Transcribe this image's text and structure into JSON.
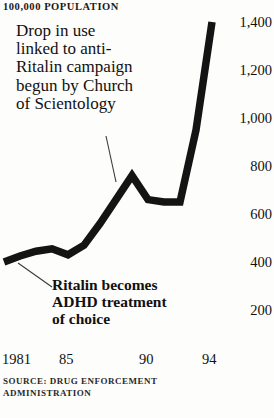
{
  "header": {
    "unit_label": "100,000 POPULATION"
  },
  "annotations": {
    "top": {
      "name": "scientology-campaign-note",
      "lines": [
        "Drop in use",
        "linked to anti-",
        "Ritalin campaign",
        "begun by Church",
        "of Scientology"
      ]
    },
    "bottom": {
      "name": "adhd-treatment-note",
      "lines": [
        "Ritalin becomes",
        "ADHD treatment",
        "of choice"
      ]
    }
  },
  "source": {
    "lines": [
      "SOURCE: DRUG ENFORCEMENT",
      "ADMINISTRATION"
    ]
  },
  "colors": {
    "line": "#141414",
    "text": "#111111",
    "background": "#fdfdfb",
    "leader": "#3a3a3a"
  },
  "chart_data": {
    "type": "line",
    "title": "",
    "subtitle": "",
    "xlabel": "",
    "ylabel": "100,000 POPULATION",
    "xlim": [
      1981,
      1994
    ],
    "ylim": [
      0,
      1500
    ],
    "grid": false,
    "legend": null,
    "y_ticks": [
      1400,
      1200,
      1000,
      800,
      600,
      400,
      200
    ],
    "y_tick_labels": [
      "1,400",
      "1,200",
      "1,000",
      "800",
      "600",
      "400",
      "200"
    ],
    "x_ticks": [
      1981,
      1985,
      1990,
      1994
    ],
    "x_tick_labels": [
      "1981",
      "85",
      "90",
      "94"
    ],
    "series": [
      {
        "name": "Ritalin prescriptions per 100,000 population",
        "x": [
          1981,
          1982,
          1983,
          1984,
          1985,
          1986,
          1987,
          1988,
          1989,
          1990,
          1991,
          1992,
          1993,
          1994
        ],
        "values": [
          400,
          425,
          445,
          455,
          430,
          470,
          560,
          660,
          760,
          660,
          650,
          650,
          950,
          1400
        ]
      }
    ],
    "annotations": [
      {
        "text": "Drop in use linked to anti-Ritalin campaign begun by Church of Scientology",
        "points_to_x": 1990,
        "points_to_y": 700
      },
      {
        "text": "Ritalin becomes ADHD treatment of choice",
        "points_to_x": 1981.4,
        "points_to_y": 395
      }
    ]
  }
}
